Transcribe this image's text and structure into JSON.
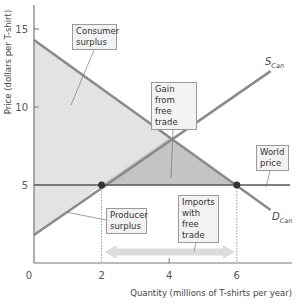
{
  "chart_data": {
    "type": "line",
    "title": "",
    "xlabel": "Quantity (millions of T-shirts per year)",
    "ylabel": "Price (dollars per T-shirt)",
    "xlim": [
      0,
      7.6
    ],
    "ylim": [
      0,
      16.5
    ],
    "x_ticks": [
      0,
      2,
      4,
      6
    ],
    "y_ticks": [
      5,
      10,
      15
    ],
    "grid": false,
    "series": [
      {
        "name": "S_Can",
        "label": "S",
        "subscript": "Can",
        "points": [
          [
            0,
            1.8
          ],
          [
            7.0,
            12.3
          ]
        ]
      },
      {
        "name": "D_Can",
        "label": "D",
        "subscript": "Can",
        "points": [
          [
            0,
            14.3
          ],
          [
            7.0,
            3.4
          ]
        ]
      },
      {
        "name": "World price",
        "points": [
          [
            0,
            5
          ],
          [
            7.6,
            5
          ]
        ]
      }
    ],
    "key_points": [
      {
        "name": "domestic-quantity-supplied",
        "x": 2,
        "y": 5
      },
      {
        "name": "domestic-quantity-demanded",
        "x": 6,
        "y": 5
      },
      {
        "name": "no-trade-equilibrium",
        "x": 4,
        "y": 8
      }
    ],
    "shaded_regions": [
      {
        "name": "Consumer surplus",
        "vertices": [
          [
            0,
            14.3
          ],
          [
            6,
            5
          ],
          [
            0,
            5
          ]
        ]
      },
      {
        "name": "Producer surplus",
        "vertices": [
          [
            0,
            5
          ],
          [
            2,
            5
          ],
          [
            0,
            1.8
          ]
        ]
      },
      {
        "name": "Gain from free trade",
        "vertices": [
          [
            2,
            5
          ],
          [
            4,
            8
          ],
          [
            6,
            5
          ]
        ]
      }
    ],
    "annotations": [
      "Consumer surplus",
      "Gain from free trade",
      "World price",
      "Producer surplus",
      "Imports with free trade"
    ],
    "imports_range": [
      2,
      6
    ]
  },
  "labels": {
    "consumer_surplus": [
      "Consumer",
      "surplus"
    ],
    "gain": [
      "Gain from",
      "free trade"
    ],
    "world_price": [
      "World",
      "price"
    ],
    "producer_surplus": [
      "Producer",
      "surplus"
    ],
    "imports": [
      "Imports",
      "with free",
      "trade"
    ],
    "supply_main": "S",
    "supply_sub": "Can",
    "demand_main": "D",
    "demand_sub": "Can"
  },
  "colors": {
    "light_fill": "#e3e3e3",
    "dark_fill": "#c4c4c4",
    "curve": "#8a8a8a",
    "world_price_line": "#555555",
    "arrow": "#dcdcdc",
    "dot": "#333333"
  }
}
